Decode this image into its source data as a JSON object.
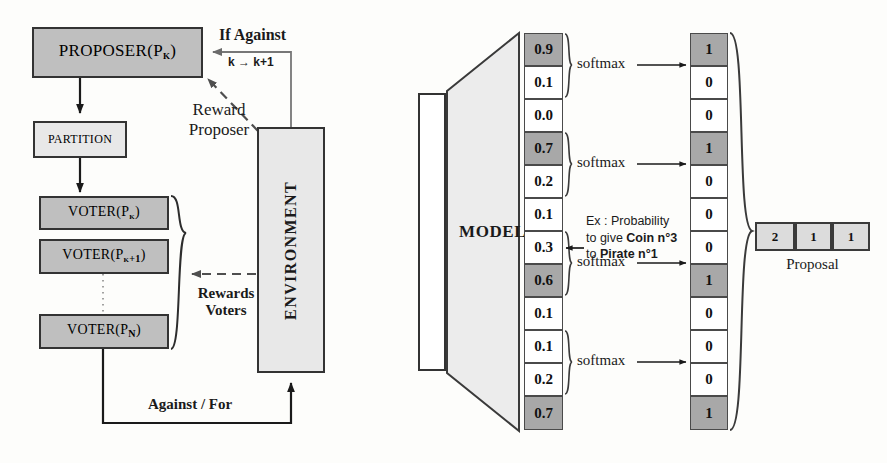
{
  "left_panel": {
    "proposer": {
      "label": "PROPOSER(P",
      "sub": "k",
      "close": ")"
    },
    "partition": {
      "label": "PARTITION"
    },
    "voters": [
      {
        "label": "VOTER(P",
        "sub": "k",
        "close": ")"
      },
      {
        "label": "VOTER(P",
        "sub": "k+1",
        "close": ")"
      },
      {
        "label": "VOTER(P",
        "sub": "N",
        "close": ")"
      }
    ],
    "environment": {
      "label": "ENVIRONMENT"
    },
    "edges": {
      "if_against": "If Against",
      "k_increment": "k → k+1",
      "reward_proposer_line1": "Reward",
      "reward_proposer_line2": "Proposer",
      "rewards_voters_line1": "Rewards",
      "rewards_voters_line2": "Voters",
      "against_for": "Against / For"
    }
  },
  "right_panel": {
    "model": {
      "label": "MODEL"
    },
    "input_vector": {
      "label": ""
    },
    "probability_vector": {
      "groups": [
        {
          "values": [
            "0.9",
            "0.1",
            "0.0"
          ],
          "highlight": [
            true,
            false,
            false
          ],
          "softmax_label": "softmax"
        },
        {
          "values": [
            "0.7",
            "0.2",
            "0.1"
          ],
          "highlight": [
            true,
            false,
            false
          ],
          "softmax_label": "softmax"
        },
        {
          "values": [
            "0.3",
            "0.6",
            "0.1"
          ],
          "highlight": [
            false,
            true,
            false
          ],
          "softmax_label": "softmax"
        },
        {
          "values": [
            "0.1",
            "0.2",
            "0.7"
          ],
          "highlight": [
            false,
            false,
            true
          ],
          "softmax_label": "softmax"
        }
      ]
    },
    "onehot_vector": {
      "groups": [
        {
          "values": [
            "1",
            "0",
            "0"
          ],
          "highlight": [
            true,
            false,
            false
          ]
        },
        {
          "values": [
            "1",
            "0",
            "0"
          ],
          "highlight": [
            true,
            false,
            false
          ]
        },
        {
          "values": [
            "0",
            "1",
            "0"
          ],
          "highlight": [
            false,
            true,
            false
          ]
        },
        {
          "values": [
            "0",
            "0",
            "1"
          ],
          "highlight": [
            false,
            false,
            true
          ]
        }
      ]
    },
    "annotation": {
      "line1": "Ex : Probability",
      "line2_plain": "to give ",
      "line2_bold": "Coin n°3",
      "line3_plain": "to ",
      "line3_bold": "Pirate n°1"
    },
    "proposal": {
      "cells": [
        "2",
        "1",
        "1"
      ],
      "caption": "Proposal"
    }
  }
}
